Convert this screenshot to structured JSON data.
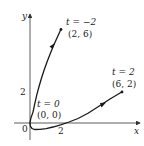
{
  "diagram": {
    "type": "parametric-curve",
    "axes": {
      "x_label": "x",
      "y_label": "y",
      "origin_label": "0"
    },
    "ticks": {
      "x": "2",
      "y": "2"
    },
    "points": [
      {
        "t_label": "t = −2",
        "coord_label": "(2, 6)"
      },
      {
        "t_label": "t = 0",
        "coord_label": "(0, 0)"
      },
      {
        "t_label": "t = 2",
        "coord_label": "(6, 2)"
      }
    ],
    "colors": {
      "curve": "#1a1a1a",
      "axes": "#333333",
      "text": "#222222"
    }
  }
}
